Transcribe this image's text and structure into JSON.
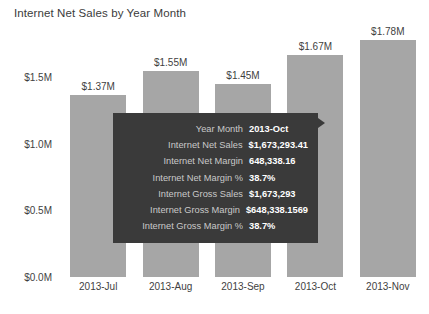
{
  "chart_data": {
    "type": "bar",
    "title": "Internet Net Sales by Year Month",
    "xlabel": "",
    "ylabel": "",
    "categories": [
      "2013-Jul",
      "2013-Aug",
      "2013-Sep",
      "2013-Oct",
      "2013-Nov"
    ],
    "values": [
      1370000,
      1550000,
      1450000,
      1670000,
      1780000
    ],
    "data_labels": [
      "$1.37M",
      "$1.55M",
      "$1.45M",
      "$1.67M",
      "$1.78M"
    ],
    "ylim": [
      0,
      1900000
    ],
    "ytick_values": [
      0,
      500000,
      1000000,
      1500000
    ],
    "ytick_labels": [
      "$0.0M",
      "$0.5M",
      "$1.0M",
      "$1.5M"
    ],
    "grid": false,
    "legend": "none",
    "bar_color": "#a6a6a6",
    "series": [
      {
        "name": "Internet Net Sales",
        "values": [
          1370000,
          1550000,
          1450000,
          1670000,
          1780000
        ]
      }
    ]
  },
  "tooltip": {
    "background_color": "#3a3a3a",
    "label_color": "#c9c9c9",
    "value_color": "#ffffff",
    "rows": [
      {
        "label": "Year Month",
        "value": "2013-Oct"
      },
      {
        "label": "Internet Net Sales",
        "value": "$1,673,293.41"
      },
      {
        "label": "Internet Net Margin",
        "value": "648,338.16"
      },
      {
        "label": "Internet Net Margin %",
        "value": "38.7%"
      },
      {
        "label": "Internet Gross Sales",
        "value": "$1,673,293"
      },
      {
        "label": "Internet Gross Margin",
        "value": "$648,338.1569"
      },
      {
        "label": "Internet Gross Margin %",
        "value": "38.7%"
      }
    ]
  }
}
